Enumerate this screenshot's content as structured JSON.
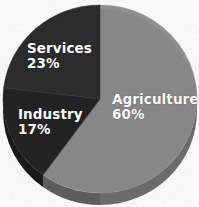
{
  "chart_data": {
    "type": "pie",
    "title": "",
    "subtitle": "",
    "xlabel": "",
    "ylabel": "",
    "legend_position": "none",
    "labels_inside_slices": true,
    "total_percent": 100,
    "categories": [
      "Agriculture",
      "Services",
      "Industry"
    ],
    "values": [
      60,
      23,
      17
    ],
    "value_unit": "%",
    "slices": [
      {
        "name": "Agriculture",
        "value": 60,
        "value_label": "60%",
        "color": "#8a8a8a",
        "side_color": "#6a6a6a",
        "start_angle_deg": 0,
        "end_angle_deg": 216,
        "label_text_color": "#ffffff"
      },
      {
        "name": "Services",
        "value": 23,
        "value_label": "23%",
        "color": "#2c2c2c",
        "side_color": "#1c1c1c",
        "start_angle_deg": 277,
        "end_angle_deg": 360,
        "label_text_color": "#ffffff"
      },
      {
        "name": "Industry",
        "value": 17,
        "value_label": "17%",
        "color": "#232323",
        "side_color": "#161616",
        "start_angle_deg": 216,
        "end_angle_deg": 277,
        "label_text_color": "#ffffff"
      }
    ],
    "style": {
      "three_d": true,
      "background": "#fdfdfd",
      "depth_px": 12,
      "center_x": 100,
      "center_y": 99,
      "radius_x": 97,
      "radius_y": 94
    }
  },
  "labels": {
    "agriculture": {
      "name": "Agriculture",
      "value": "60%"
    },
    "services": {
      "name": "Services",
      "value": "23%"
    },
    "industry": {
      "name": "Industry",
      "value": "17%"
    }
  }
}
